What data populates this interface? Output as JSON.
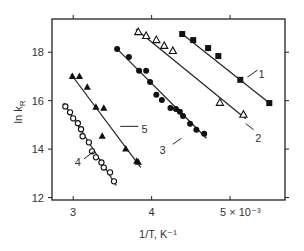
{
  "chart_data": {
    "type": "scatter",
    "title": "",
    "xlabel": "1/T, K⁻¹",
    "ylabel": "ln k_R",
    "xlim": [
      2.73,
      5.7
    ],
    "ylim": [
      11.9,
      19.37
    ],
    "x_ticks": [
      3,
      4,
      5
    ],
    "x_tick_labels": [
      "3",
      "4",
      "5 × 10⁻³"
    ],
    "y_ticks": [
      12,
      14,
      16,
      18
    ],
    "y_tick_labels": [
      "12",
      "14",
      "16",
      "18"
    ],
    "grid": false,
    "legend": "inline numbered labels",
    "series": [
      {
        "name": "1",
        "marker": "filled-square",
        "points": [
          [
            4.39,
            18.75
          ],
          [
            4.53,
            18.5
          ],
          [
            4.72,
            18.17
          ],
          [
            4.85,
            17.84
          ],
          [
            5.13,
            16.86
          ],
          [
            5.5,
            15.9
          ]
        ],
        "fit": [
          [
            4.37,
            18.8
          ],
          [
            5.52,
            15.85
          ]
        ],
        "label_pos": [
          5.4,
          17.1
        ],
        "leader": [
          [
            5.22,
            16.97
          ],
          [
            5.35,
            17.26
          ]
        ]
      },
      {
        "name": "2",
        "marker": "open-triangle",
        "points": [
          [
            3.83,
            18.83
          ],
          [
            3.93,
            18.67
          ],
          [
            4.06,
            18.5
          ],
          [
            4.16,
            18.26
          ],
          [
            4.27,
            18.05
          ],
          [
            4.87,
            15.91
          ],
          [
            5.17,
            15.42
          ]
        ],
        "fit": [
          [
            3.8,
            18.95
          ],
          [
            5.2,
            15.25
          ]
        ],
        "label_pos": [
          5.36,
          14.45
        ],
        "leader": [
          [
            5.2,
            15.05
          ],
          [
            5.3,
            14.8
          ]
        ]
      },
      {
        "name": "3",
        "marker": "filled-circle",
        "points": [
          [
            3.56,
            18.13
          ],
          [
            3.71,
            17.8
          ],
          [
            3.84,
            17.23
          ],
          [
            3.93,
            17.23
          ],
          [
            3.98,
            16.77
          ],
          [
            4.06,
            16.24
          ],
          [
            4.13,
            16.03
          ],
          [
            4.24,
            15.7
          ],
          [
            4.31,
            15.66
          ],
          [
            4.36,
            15.54
          ],
          [
            4.4,
            15.37
          ],
          [
            4.49,
            15.05
          ],
          [
            4.57,
            14.8
          ],
          [
            4.67,
            14.63
          ]
        ],
        "fit": [
          [
            3.54,
            18.2
          ],
          [
            4.7,
            14.45
          ]
        ],
        "label_pos": [
          4.14,
          13.95
        ],
        "leader": [
          [
            4.27,
            14.2
          ],
          [
            4.38,
            14.45
          ]
        ]
      },
      {
        "name": "4",
        "marker": "open-circle",
        "points": [
          [
            2.9,
            15.76
          ],
          [
            2.96,
            15.52
          ],
          [
            3.0,
            15.27
          ],
          [
            3.06,
            15.07
          ],
          [
            3.1,
            14.82
          ],
          [
            3.12,
            14.53
          ],
          [
            3.2,
            14.28
          ],
          [
            3.24,
            13.91
          ],
          [
            3.29,
            13.66
          ],
          [
            3.36,
            13.45
          ],
          [
            3.39,
            13.24
          ],
          [
            3.47,
            13.04
          ],
          [
            3.52,
            12.67
          ]
        ],
        "fit": [
          [
            2.88,
            15.9
          ],
          [
            3.55,
            12.5
          ]
        ],
        "label_pos": [
          3.06,
          13.45
        ],
        "leader": [
          [
            3.14,
            13.6
          ],
          [
            3.26,
            13.9
          ]
        ]
      },
      {
        "name": "5",
        "marker": "filled-triangle",
        "points": [
          [
            2.99,
            17.0
          ],
          [
            3.08,
            17.0
          ],
          [
            3.18,
            16.55
          ],
          [
            3.29,
            15.73
          ],
          [
            3.39,
            15.69
          ],
          [
            3.37,
            14.53
          ],
          [
            3.67,
            14.0
          ],
          [
            3.81,
            13.5
          ],
          [
            3.83,
            13.46
          ]
        ],
        "fit": [
          [
            2.97,
            17.1
          ],
          [
            3.86,
            13.25
          ]
        ],
        "label_pos": [
          3.91,
          14.85
        ],
        "leader": [
          [
            3.6,
            14.94
          ],
          [
            3.83,
            14.94
          ]
        ]
      }
    ]
  }
}
